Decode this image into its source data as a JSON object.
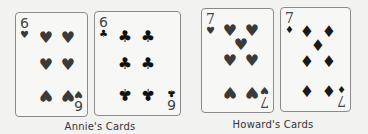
{
  "groups": [
    {
      "caption": "Annie's Cards",
      "cards": [
        {
          "rank": "6",
          "suit": "hearts",
          "suit_glyph": "♥",
          "pip_count": 6
        },
        {
          "rank": "6",
          "suit": "clubs",
          "suit_glyph": "♣",
          "pip_count": 6
        }
      ]
    },
    {
      "caption": "Howard's Cards",
      "cards": [
        {
          "rank": "7",
          "suit": "hearts",
          "suit_glyph": "♥",
          "pip_count": 7
        },
        {
          "rank": "7",
          "suit": "diamonds",
          "suit_glyph": "♦",
          "pip_count": 7
        }
      ]
    }
  ]
}
